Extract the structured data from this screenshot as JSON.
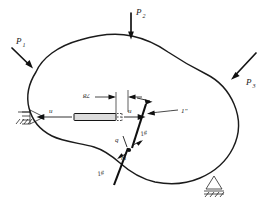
{
  "figure": {
    "type": "engineering-mechanics-free-body-diagram",
    "loads": [
      {
        "id": "P1",
        "label": "P",
        "subscript": "1",
        "position": "upper-left",
        "direction": "down-right"
      },
      {
        "id": "P2",
        "label": "P",
        "subscript": "2",
        "position": "top-center",
        "direction": "down"
      },
      {
        "id": "P3",
        "label": "P",
        "subscript": "3",
        "position": "right",
        "direction": "down-left"
      }
    ],
    "supports": [
      {
        "id": "support-left",
        "type": "pinned-hatched",
        "position": "left"
      },
      {
        "id": "support-right",
        "type": "pinned-hatched",
        "position": "bottom-right"
      }
    ],
    "section_cut": {
      "label_lower": "1#",
      "label_upper": "1#",
      "callout": "1\"",
      "name": "section-1-1"
    },
    "element": {
      "displacement_left": "u",
      "displacement_right": "u",
      "dimension_label": "78"
    },
    "point_labels": [
      {
        "id": "point-q",
        "text": "q"
      },
      {
        "id": "point-m",
        "text": "m"
      }
    ]
  }
}
